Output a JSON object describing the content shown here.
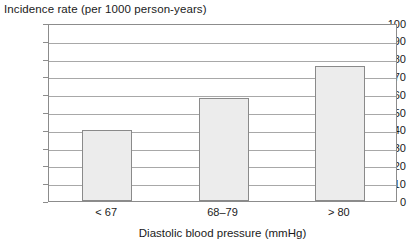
{
  "chart_data": {
    "type": "bar",
    "title": "Incidence rate (per 1000 person-years)",
    "xlabel": "Diastolic blood pressure (mmHg)",
    "ylabel": "Incidence rate (per 1000 person-years)",
    "categories": [
      "< 67",
      "68–79",
      "> 80"
    ],
    "values": [
      40,
      58,
      76
    ],
    "ylim": [
      0,
      100
    ],
    "ytick_labels": [
      "0",
      "10",
      "20",
      "30",
      "40",
      "50",
      "60",
      "70",
      "80",
      "90",
      "100"
    ],
    "ytick_values": [
      0,
      10,
      20,
      30,
      40,
      50,
      60,
      70,
      80,
      90,
      100
    ],
    "grid": true,
    "grid_axis": "y",
    "legend": false,
    "bar_fill_color": "#ececec",
    "bar_border_color": "#8a8a8a",
    "gridline_color": "#a8a8a8",
    "axis_color": "#8c8c8c"
  }
}
